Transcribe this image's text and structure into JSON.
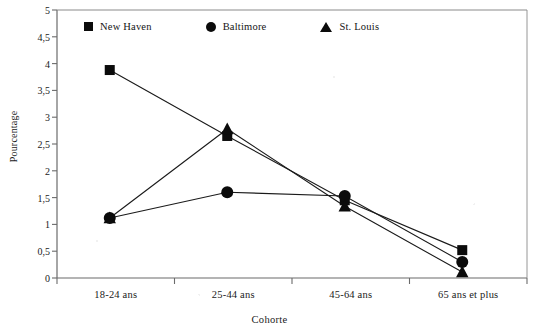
{
  "chart_data": {
    "type": "line",
    "title": "",
    "xlabel": "Cohorte",
    "ylabel": "Pourcentage",
    "categories": [
      "18-24 ans",
      "25-44 ans",
      "45-64 ans",
      "65 ans et plus"
    ],
    "series": [
      {
        "name": "New Haven",
        "marker": "square",
        "values": [
          3.88,
          2.65,
          1.45,
          0.52
        ]
      },
      {
        "name": "Baltimore",
        "marker": "circle",
        "values": [
          1.12,
          1.6,
          1.53,
          0.3
        ]
      },
      {
        "name": "St. Louis",
        "marker": "triangle",
        "values": [
          1.12,
          2.78,
          1.34,
          0.11
        ]
      }
    ],
    "ylim": [
      0,
      5
    ],
    "ytick_labels": [
      "0",
      "0,5",
      "1",
      "1,5",
      "2",
      "2,5",
      "3",
      "3,5",
      "4",
      "4,5",
      "5"
    ],
    "ytick_values": [
      0,
      0.5,
      1,
      1.5,
      2,
      2.5,
      3,
      3.5,
      4,
      4.5,
      5
    ],
    "grid": false,
    "legend_position": "top-inside",
    "line_color": "#1a1a1a",
    "marker_color": "#0b0b0b",
    "axis_color": "#6b6b6b"
  },
  "legend": {
    "items": [
      {
        "label": "New Haven",
        "marker": "square-marker-icon"
      },
      {
        "label": "Baltimore",
        "marker": "circle-marker-icon"
      },
      {
        "label": "St. Louis",
        "marker": "triangle-marker-icon"
      }
    ]
  },
  "axes": {
    "y_title": "Pourcentage",
    "x_title": "Cohorte"
  }
}
